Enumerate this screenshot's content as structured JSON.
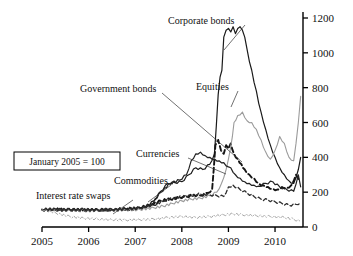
{
  "chart_data": {
    "type": "line",
    "title": "",
    "subtitle": "",
    "xlabel": "",
    "ylabel": "",
    "annotation": "January 2005 = 100",
    "xlim": [
      2005.0,
      2010.6
    ],
    "ylim": [
      0,
      1200
    ],
    "grid": false,
    "legend_position": "inline-labels",
    "x_ticks": [
      "2005",
      "2006",
      "2007",
      "2008",
      "2009",
      "2010"
    ],
    "x_tick_values": [
      2005,
      2006,
      2007,
      2008,
      2009,
      2010
    ],
    "y_ticks": [
      "0",
      "200",
      "400",
      "600",
      "800",
      "1000",
      "1200"
    ],
    "y_tick_values": [
      0,
      200,
      400,
      600,
      800,
      1000,
      1200
    ],
    "y_axis_side": "right",
    "series": [
      {
        "name": "Corporate bonds",
        "style": "solid",
        "color": "#1a1a1a",
        "width": 1.2,
        "x": [
          2005.0,
          2005.25,
          2005.5,
          2005.75,
          2006.0,
          2006.25,
          2006.5,
          2006.75,
          2007.0,
          2007.25,
          2007.4,
          2007.55,
          2007.7,
          2007.85,
          2008.0,
          2008.15,
          2008.3,
          2008.45,
          2008.6,
          2008.7,
          2008.78,
          2008.82,
          2008.86,
          2008.9,
          2008.95,
          2009.0,
          2009.05,
          2009.1,
          2009.15,
          2009.2,
          2009.25,
          2009.3,
          2009.35,
          2009.4,
          2009.5,
          2009.6,
          2009.7,
          2009.8,
          2009.9,
          2010.0,
          2010.1,
          2010.2,
          2010.3,
          2010.4,
          2010.5,
          2010.55
        ],
        "y": [
          100,
          104,
          101,
          98,
          99,
          97,
          98,
          101,
          104,
          118,
          150,
          205,
          250,
          255,
          260,
          300,
          340,
          330,
          360,
          420,
          760,
          860,
          900,
          1090,
          1130,
          1140,
          1120,
          1150,
          1110,
          1140,
          1150,
          1130,
          1090,
          1020,
          900,
          780,
          660,
          560,
          470,
          400,
          340,
          300,
          265,
          250,
          330,
          400
        ]
      },
      {
        "name": "Equities",
        "style": "dashed-thick",
        "color": "#141414",
        "width": 1.9,
        "x": [
          2005.0,
          2005.3,
          2005.6,
          2005.9,
          2006.2,
          2006.5,
          2006.8,
          2007.1,
          2007.35,
          2007.55,
          2007.75,
          2007.95,
          2008.1,
          2008.25,
          2008.4,
          2008.55,
          2008.65,
          2008.72,
          2008.78,
          2008.84,
          2008.9,
          2008.95,
          2009.0,
          2009.05,
          2009.12,
          2009.2,
          2009.28,
          2009.35,
          2009.45,
          2009.55,
          2009.65,
          2009.75,
          2009.85,
          2009.95,
          2010.05,
          2010.15,
          2010.25,
          2010.35,
          2010.45,
          2010.55
        ],
        "y": [
          100,
          97,
          99,
          96,
          98,
          100,
          103,
          110,
          130,
          150,
          160,
          170,
          175,
          185,
          180,
          195,
          215,
          470,
          500,
          440,
          420,
          470,
          450,
          480,
          420,
          390,
          360,
          330,
          300,
          280,
          250,
          240,
          230,
          220,
          215,
          230,
          225,
          240,
          300,
          265
        ]
      },
      {
        "name": "Government bonds",
        "style": "solid-light",
        "color": "#9b9b9b",
        "width": 1.1,
        "x": [
          2005.0,
          2005.3,
          2005.6,
          2005.9,
          2006.2,
          2006.5,
          2006.8,
          2007.1,
          2007.4,
          2007.6,
          2007.8,
          2008.0,
          2008.2,
          2008.4,
          2008.6,
          2008.75,
          2008.85,
          2008.95,
          2009.0,
          2009.05,
          2009.12,
          2009.2,
          2009.3,
          2009.4,
          2009.5,
          2009.6,
          2009.7,
          2009.8,
          2009.9,
          2010.0,
          2010.1,
          2010.2,
          2010.3,
          2010.4,
          2010.5,
          2010.55
        ],
        "y": [
          100,
          98,
          95,
          97,
          96,
          98,
          97,
          100,
          110,
          120,
          135,
          150,
          160,
          165,
          180,
          200,
          250,
          330,
          390,
          460,
          600,
          640,
          660,
          610,
          600,
          560,
          500,
          430,
          390,
          440,
          520,
          480,
          400,
          380,
          600,
          750
        ]
      },
      {
        "name": "Currencies",
        "style": "solid",
        "color": "#232323",
        "width": 1.2,
        "x": [
          2005.0,
          2005.3,
          2005.6,
          2005.9,
          2006.2,
          2006.5,
          2006.8,
          2007.1,
          2007.35,
          2007.55,
          2007.75,
          2007.95,
          2008.1,
          2008.2,
          2008.3,
          2008.4,
          2008.5,
          2008.6,
          2008.7,
          2008.8,
          2008.9,
          2009.0,
          2009.05,
          2009.15,
          2009.25,
          2009.35,
          2009.45,
          2009.55,
          2009.65,
          2009.8,
          2009.95,
          2010.1,
          2010.25,
          2010.4,
          2010.5,
          2010.55
        ],
        "y": [
          100,
          102,
          99,
          101,
          98,
          100,
          103,
          108,
          130,
          200,
          250,
          270,
          300,
          380,
          420,
          430,
          410,
          400,
          390,
          380,
          370,
          345,
          340,
          300,
          280,
          260,
          250,
          240,
          235,
          250,
          260,
          230,
          215,
          205,
          300,
          230
        ]
      },
      {
        "name": "Commodities",
        "style": "dashed",
        "color": "#2e2e2e",
        "width": 1.3,
        "x": [
          2005.0,
          2005.3,
          2005.6,
          2005.9,
          2006.2,
          2006.5,
          2006.8,
          2007.1,
          2007.4,
          2007.6,
          2007.8,
          2008.0,
          2008.2,
          2008.4,
          2008.6,
          2008.75,
          2008.9,
          2009.0,
          2009.1,
          2009.25,
          2009.4,
          2009.55,
          2009.7,
          2009.85,
          2010.0,
          2010.15,
          2010.3,
          2010.45,
          2010.55
        ],
        "y": [
          100,
          103,
          100,
          102,
          99,
          101,
          104,
          110,
          125,
          150,
          165,
          175,
          180,
          190,
          185,
          180,
          175,
          230,
          240,
          215,
          195,
          175,
          160,
          155,
          145,
          135,
          125,
          130,
          140
        ]
      },
      {
        "name": "Interest rate swaps",
        "style": "dash-dot-light",
        "color": "#a6a6a6",
        "width": 1.0,
        "x": [
          2005.0,
          2005.3,
          2005.6,
          2005.9,
          2006.2,
          2006.5,
          2006.8,
          2007.1,
          2007.4,
          2007.7,
          2008.0,
          2008.3,
          2008.6,
          2008.9,
          2009.1,
          2009.3,
          2009.6,
          2009.9,
          2010.2,
          2010.4,
          2010.55
        ],
        "y": [
          100,
          80,
          60,
          50,
          45,
          42,
          40,
          42,
          45,
          55,
          60,
          55,
          60,
          70,
          75,
          70,
          65,
          60,
          55,
          45,
          30
        ]
      }
    ],
    "annotations": [
      {
        "label": "Corporate bonds",
        "label_x": 168,
        "label_y": 24,
        "leader_to_x": 224,
        "leader_to_y": 50
      },
      {
        "label": "Equities",
        "label_x": 196,
        "label_y": 90,
        "leader_to_x": 231,
        "leader_to_y": 107
      },
      {
        "label": "Government bonds",
        "label_x": 80,
        "label_y": 92,
        "leader_to_x": 242,
        "leader_to_y": 162
      },
      {
        "label": "Currencies",
        "label_x": 136,
        "label_y": 157,
        "leader_to_x": 226,
        "leader_to_y": 174
      },
      {
        "label": "Commodities",
        "label_x": 114,
        "label_y": 184,
        "leader_to_x": 148,
        "leader_to_y": 202
      },
      {
        "label": "Interest rate swaps",
        "label_x": 36,
        "label_y": 199,
        "leader_to_x": 113,
        "leader_to_y": 214
      }
    ]
  }
}
